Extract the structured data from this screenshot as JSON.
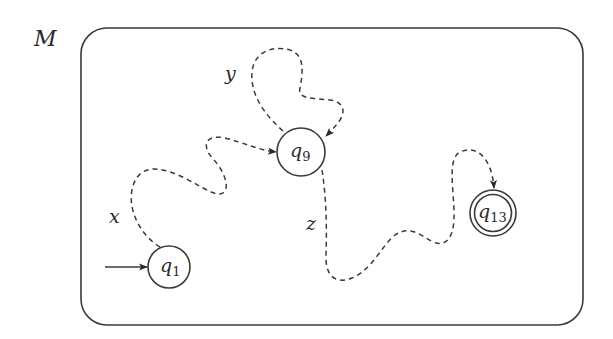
{
  "machine": {
    "name": "M"
  },
  "states": [
    {
      "id": "q1",
      "base": "q",
      "index": "1",
      "start": true,
      "accepting": false
    },
    {
      "id": "q9",
      "base": "q",
      "index": "9",
      "start": false,
      "accepting": false
    },
    {
      "id": "q13",
      "base": "q",
      "index": "13",
      "start": false,
      "accepting": true
    }
  ],
  "paths": [
    {
      "label": "x",
      "from": "q1",
      "to": "q9"
    },
    {
      "label": "y",
      "from": "q9",
      "to": "q9"
    },
    {
      "label": "z",
      "from": "q9",
      "to": "q13"
    }
  ],
  "colors": {
    "stroke": "#3a3a3a",
    "background": "#ffffff"
  }
}
